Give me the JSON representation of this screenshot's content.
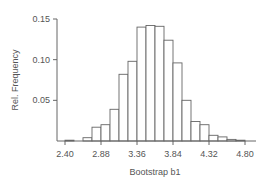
{
  "chart_data": {
    "type": "bar",
    "title": "",
    "xlabel": "Bootstrap b1",
    "ylabel": "Rel. Frequency",
    "xlim": [
      2.4,
      4.8
    ],
    "ylim": [
      0,
      0.15
    ],
    "grid": false,
    "legend": null,
    "bin_width": 0.12,
    "x_ticks": [
      "2.40",
      "2.88",
      "3.36",
      "3.84",
      "4.32",
      "4.80"
    ],
    "y_ticks": [
      "0.05",
      "0.10",
      "0.15"
    ],
    "bins": [
      {
        "start": 2.4,
        "end": 2.52,
        "value": 0.001
      },
      {
        "start": 2.52,
        "end": 2.64,
        "value": 0.0
      },
      {
        "start": 2.64,
        "end": 2.76,
        "value": 0.004
      },
      {
        "start": 2.76,
        "end": 2.88,
        "value": 0.017
      },
      {
        "start": 2.88,
        "end": 3.0,
        "value": 0.02
      },
      {
        "start": 3.0,
        "end": 3.12,
        "value": 0.039
      },
      {
        "start": 3.12,
        "end": 3.24,
        "value": 0.082
      },
      {
        "start": 3.24,
        "end": 3.36,
        "value": 0.098
      },
      {
        "start": 3.36,
        "end": 3.48,
        "value": 0.14
      },
      {
        "start": 3.48,
        "end": 3.6,
        "value": 0.142
      },
      {
        "start": 3.6,
        "end": 3.72,
        "value": 0.141
      },
      {
        "start": 3.72,
        "end": 3.84,
        "value": 0.124
      },
      {
        "start": 3.84,
        "end": 3.96,
        "value": 0.096
      },
      {
        "start": 3.96,
        "end": 4.08,
        "value": 0.05
      },
      {
        "start": 4.08,
        "end": 4.2,
        "value": 0.024
      },
      {
        "start": 4.2,
        "end": 4.32,
        "value": 0.02
      },
      {
        "start": 4.32,
        "end": 4.44,
        "value": 0.007
      },
      {
        "start": 4.44,
        "end": 4.56,
        "value": 0.005
      },
      {
        "start": 4.56,
        "end": 4.68,
        "value": 0.002
      },
      {
        "start": 4.68,
        "end": 4.8,
        "value": 0.001
      }
    ],
    "categories": [
      "2.40-2.52",
      "2.52-2.64",
      "2.64-2.76",
      "2.76-2.88",
      "2.88-3.00",
      "3.00-3.12",
      "3.12-3.24",
      "3.24-3.36",
      "3.36-3.48",
      "3.48-3.60",
      "3.60-3.72",
      "3.72-3.84",
      "3.84-3.96",
      "3.96-4.08",
      "4.08-4.20",
      "4.20-4.32",
      "4.32-4.44",
      "4.44-4.56",
      "4.56-4.68",
      "4.68-4.80"
    ],
    "values": [
      0.001,
      0.0,
      0.004,
      0.017,
      0.02,
      0.039,
      0.082,
      0.098,
      0.14,
      0.142,
      0.141,
      0.124,
      0.096,
      0.05,
      0.024,
      0.02,
      0.007,
      0.005,
      0.002,
      0.001
    ]
  },
  "colors": {
    "bar_fill": "#ffffff",
    "bar_stroke": "#666666",
    "axis": "#666666",
    "text": "#555555"
  }
}
